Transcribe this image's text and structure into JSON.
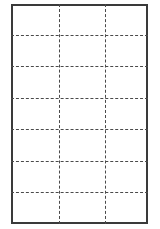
{
  "diagram": {
    "type": "grid",
    "background_color": "#ffffff",
    "frame": {
      "name": "outer-rectangle",
      "style": "solid",
      "color": "#3a3a3a",
      "stroke_width_px": 2,
      "x": 11,
      "y": 4,
      "width": 137,
      "height": 220
    },
    "grid": {
      "line_style": "dashed",
      "line_color": "#4a4a4a",
      "stroke_width_px": 1.5,
      "dash_pattern": "4 3",
      "columns": 3,
      "rows": 7,
      "vertical_lines": [
        {
          "label": "v1",
          "x": 46
        },
        {
          "label": "v2",
          "x": 92
        }
      ],
      "horizontal_lines": [
        {
          "label": "h1",
          "y": 29
        },
        {
          "label": "h2",
          "y": 60
        },
        {
          "label": "h3",
          "y": 92
        },
        {
          "label": "h4",
          "y": 123
        },
        {
          "label": "h5",
          "y": 155
        },
        {
          "label": "h6",
          "y": 186
        }
      ]
    }
  }
}
